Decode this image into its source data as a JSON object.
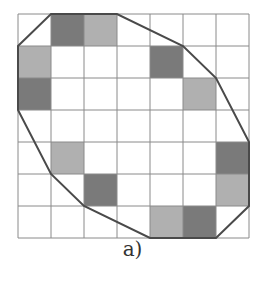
{
  "caption": "a)",
  "grid": {
    "rows": 7,
    "cols": 7,
    "origin_x": 18,
    "origin_y": 14,
    "cell_w": 33,
    "cell_h": 32,
    "line_color": "#8a8a8a"
  },
  "colors": {
    "dark": "#7a7a7a",
    "light": "#b0b0b0",
    "polygon_stroke": "#4a4a4a"
  },
  "shaded_cells": [
    {
      "row": 0,
      "col": 1,
      "shade": "dark"
    },
    {
      "row": 0,
      "col": 2,
      "shade": "light"
    },
    {
      "row": 1,
      "col": 0,
      "shade": "light"
    },
    {
      "row": 1,
      "col": 4,
      "shade": "dark"
    },
    {
      "row": 2,
      "col": 0,
      "shade": "dark"
    },
    {
      "row": 2,
      "col": 5,
      "shade": "light"
    },
    {
      "row": 4,
      "col": 1,
      "shade": "light"
    },
    {
      "row": 4,
      "col": 6,
      "shade": "dark"
    },
    {
      "row": 5,
      "col": 2,
      "shade": "dark"
    },
    {
      "row": 5,
      "col": 6,
      "shade": "light"
    },
    {
      "row": 6,
      "col": 4,
      "shade": "light"
    },
    {
      "row": 6,
      "col": 5,
      "shade": "dark"
    }
  ],
  "polygon": [
    [
      0,
      1
    ],
    [
      1,
      0
    ],
    [
      3,
      0
    ],
    [
      5,
      1
    ],
    [
      6,
      2
    ],
    [
      7,
      4
    ],
    [
      7,
      6
    ],
    [
      6,
      7
    ],
    [
      4,
      7
    ],
    [
      2,
      6
    ],
    [
      1,
      5
    ],
    [
      0,
      3
    ]
  ]
}
